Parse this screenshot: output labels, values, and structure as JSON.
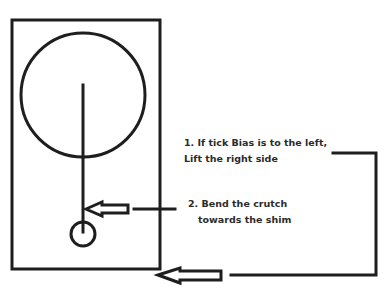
{
  "diagram": {
    "type": "pendulum-adjustment-diagram",
    "stroke_color": "#1e1e1e",
    "text_color": "#2b2b2b",
    "annotations": [
      {
        "id": "step-1",
        "lines": [
          "1. If tick Bias is to the left,",
          "Lift the right side"
        ]
      },
      {
        "id": "step-2",
        "lines": [
          "2. Bend the crutch",
          "towards the shim"
        ]
      }
    ]
  }
}
